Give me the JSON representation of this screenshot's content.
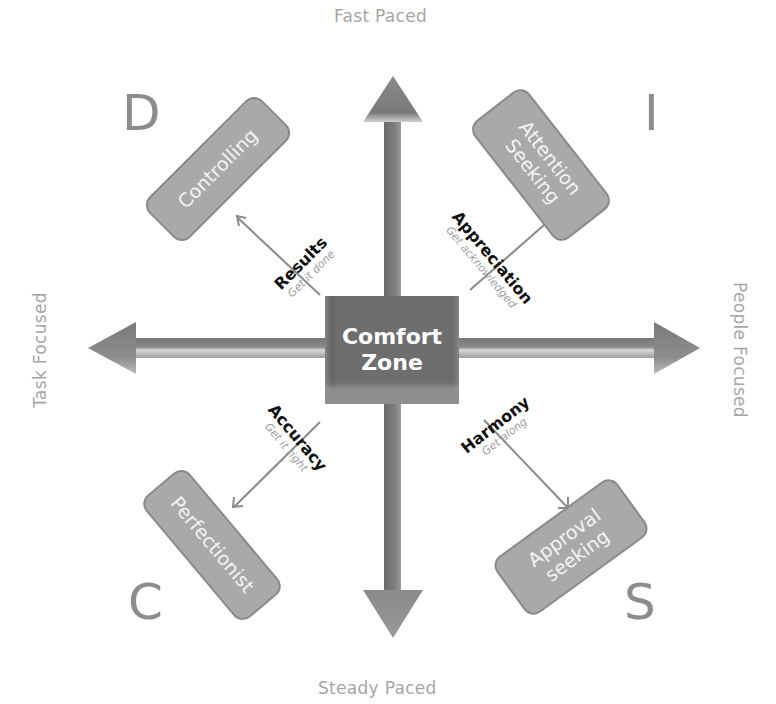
{
  "diagram": {
    "center": {
      "line1": "Comfort",
      "line2": "Zone"
    },
    "axes": {
      "top": "Fast Paced",
      "bottom": "Steady Paced",
      "left": "Task Focused",
      "right": "People Focused"
    },
    "quadrants": [
      {
        "letter": "D",
        "style": "Controlling",
        "need": "Results",
        "motto": "Get it done"
      },
      {
        "letter": "I",
        "style": "Attention Seeking",
        "style_line1": "Attention",
        "style_line2": "Seeking",
        "need": "Appreciation",
        "motto": "Get acknowledged"
      },
      {
        "letter": "C",
        "style": "Perfectionist",
        "need": "Accuracy",
        "motto": "Get it right"
      },
      {
        "letter": "S",
        "style": "Approval seeking",
        "style_line1": "Approval",
        "style_line2": "seeking",
        "need": "Harmony",
        "motto": "Get along"
      }
    ],
    "colors": {
      "background": "#ffffff",
      "arrow": "#7a7a7a",
      "box_fill": "#a9a9a9",
      "center_fill": "#6e6e6e",
      "axis_label": "#a6a6a6",
      "letter": "#8c8c8c"
    }
  }
}
